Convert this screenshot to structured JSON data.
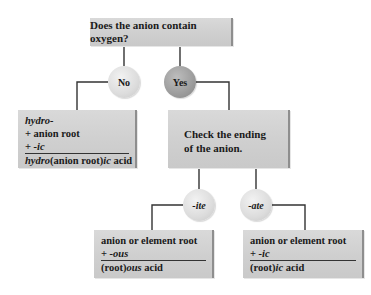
{
  "question_box": {
    "text": "Does the anion contain oxygen?"
  },
  "decisions": {
    "no": "No",
    "yes": "Yes"
  },
  "no_branch": {
    "line1": "hydro-",
    "line2": "+ anion root",
    "line3_prefix": "+ ",
    "line3_suffix": "-ic",
    "result_prefix": "hydro",
    "result_mid": "(anion root)",
    "result_suffix": "ic",
    "result_tail": " acid"
  },
  "yes_branch": {
    "line1": "Check the ending",
    "line2": "of the anion."
  },
  "ending_decisions": {
    "ite": "-ite",
    "ate": "-ate"
  },
  "ite_branch": {
    "line1": "anion or element root",
    "line2_prefix": "+ ",
    "line2_suffix": "-ous",
    "result_prefix": "(root)",
    "result_suffix": "ous",
    "result_tail": " acid"
  },
  "ate_branch": {
    "line1": "anion or element root",
    "line2_prefix": "+ ",
    "line2_suffix": "-ic",
    "result_prefix": "(root)",
    "result_suffix": "ic",
    "result_tail": " acid"
  },
  "colors": {
    "box_fill": "#d3d3d3",
    "box_edge": "#8e8e8e",
    "circle_light": "#dcdcdc",
    "circle_dark": "#9c9c9c",
    "connector": "#333333"
  }
}
